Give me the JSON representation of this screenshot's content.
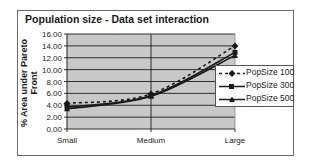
{
  "chart_data": {
    "type": "line",
    "title": "Population size - Data set interaction",
    "xlabel": "",
    "ylabel": "% Area under Pareto Front",
    "categories": [
      "Small",
      "Medium",
      "Large"
    ],
    "ylim": [
      0,
      16
    ],
    "yticks": [
      "0.00",
      "2.00",
      "4.00",
      "6.00",
      "8.00",
      "10.00",
      "12.00",
      "14.00",
      "16.00"
    ],
    "grid": true,
    "legend_position": "right",
    "series": [
      {
        "name": "PopSize 100",
        "values": [
          4.3,
          5.9,
          14.0
        ],
        "style": "dashed",
        "marker": "diamond"
      },
      {
        "name": "PopSize 300",
        "values": [
          3.7,
          5.6,
          12.9
        ],
        "style": "solid",
        "marker": "square"
      },
      {
        "name": "PopSize 500",
        "values": [
          3.4,
          5.5,
          12.4
        ],
        "style": "solid",
        "marker": "triangle"
      }
    ]
  },
  "colors": {
    "plot_background": "#c8c8c8",
    "gridline": "#1e1e1e",
    "series_line": "#1a1a1a"
  }
}
